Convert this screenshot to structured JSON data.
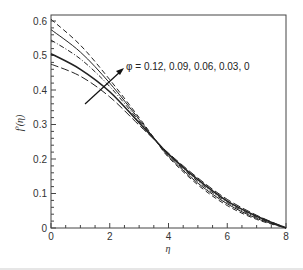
{
  "chart_data": {
    "type": "line",
    "title": "",
    "xlabel": "η",
    "ylabel": "f′(η)",
    "xlim": [
      0,
      8
    ],
    "ylim": [
      0,
      0.6
    ],
    "xticks": [
      0,
      2,
      4,
      6,
      8
    ],
    "yticks": [
      0,
      0.1,
      0.2,
      0.3,
      0.4,
      0.5,
      0.6
    ],
    "grid": false,
    "annotation": {
      "text": "φ = 0.12, 0.09, 0.06, 0.03, 0",
      "arrow_direction": "decreasing φ from top curve to bottom curve at small η"
    },
    "x": [
      0,
      1,
      2,
      3,
      3.6,
      4,
      5,
      6,
      7,
      8
    ],
    "series": [
      {
        "name": "φ = 0.12",
        "style": "dashed",
        "values": [
          0.605,
          0.53,
          0.43,
          0.32,
          0.25,
          0.205,
          0.125,
          0.065,
          0.025,
          0.0
        ]
      },
      {
        "name": "φ = 0.09",
        "style": "solid",
        "values": [
          0.575,
          0.51,
          0.42,
          0.315,
          0.25,
          0.208,
          0.13,
          0.07,
          0.028,
          0.0
        ]
      },
      {
        "name": "φ = 0.06",
        "style": "dash-dot",
        "values": [
          0.545,
          0.49,
          0.41,
          0.31,
          0.25,
          0.211,
          0.135,
          0.074,
          0.031,
          0.0
        ]
      },
      {
        "name": "φ = 0.03",
        "style": "solid-thick",
        "values": [
          0.505,
          0.46,
          0.395,
          0.305,
          0.25,
          0.214,
          0.14,
          0.078,
          0.034,
          0.0
        ]
      },
      {
        "name": "φ = 0",
        "style": "long-dashed",
        "values": [
          0.475,
          0.44,
          0.38,
          0.298,
          0.25,
          0.217,
          0.145,
          0.083,
          0.037,
          0.0
        ]
      }
    ]
  }
}
